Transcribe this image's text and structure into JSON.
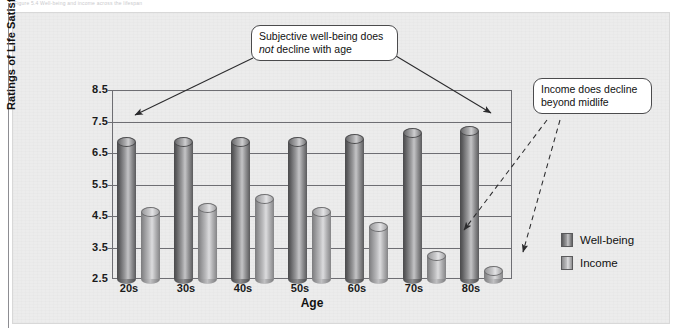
{
  "figure": {
    "top_caption": "Figure 5.4  Well-being and income across the lifespan",
    "background_color": "#ececec",
    "panel_border_color": "#d8d8d8"
  },
  "axes": {
    "y_title": "Ratings of Life Satisfaction, Income",
    "x_title": "Age",
    "y_ticks": [
      "8.5",
      "7.5",
      "6.5",
      "5.5",
      "4.5",
      "3.5",
      "2.5"
    ],
    "x_ticks": [
      "20s",
      "30s",
      "40s",
      "50s",
      "60s",
      "70s",
      "80s"
    ]
  },
  "legend": {
    "position": "right",
    "items": [
      {
        "label": "Well-being",
        "color": "#6e6e70",
        "name": "legend-well-being"
      },
      {
        "label": "Income",
        "color": "#b4b4b6",
        "name": "legend-income"
      }
    ]
  },
  "callouts": [
    {
      "id": "wellbeing",
      "text_before": "Subjective well-being does ",
      "emphasis": "not",
      "text_after": " decline with age",
      "plain_text": "Subjective well-being does not decline with age",
      "arrow_style": "solid",
      "targets": [
        "20s well-being bar",
        "80s well-being bar"
      ]
    },
    {
      "id": "income",
      "plain_text": "Income does decline beyond midlife",
      "arrow_style": "dashed",
      "targets": [
        "70s income bar",
        "80s income bar"
      ]
    }
  ],
  "chart_data": {
    "type": "bar",
    "title": "",
    "xlabel": "Age",
    "ylabel": "Ratings of Life Satisfaction, Income",
    "categories": [
      "20s",
      "30s",
      "40s",
      "50s",
      "60s",
      "70s",
      "80s"
    ],
    "series": [
      {
        "name": "Well-being",
        "color": "#6e6e70",
        "values": [
          7.0,
          7.0,
          7.0,
          7.0,
          7.1,
          7.3,
          7.35
        ]
      },
      {
        "name": "Income",
        "color": "#b4b4b6",
        "values": [
          4.8,
          4.9,
          5.2,
          4.8,
          4.3,
          3.4,
          2.9
        ]
      }
    ],
    "ylim": [
      2.5,
      8.5
    ],
    "ytick_step": 1.0,
    "grid": true,
    "legend_position": "right",
    "bar_style": "cylinder",
    "annotations": [
      "Subjective well-being does not decline with age",
      "Income does decline beyond midlife"
    ]
  }
}
